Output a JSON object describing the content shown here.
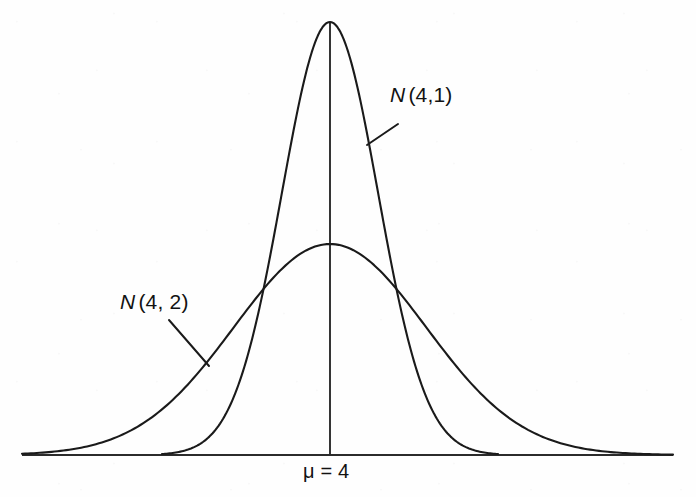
{
  "figure": {
    "background_color": "#fefefe",
    "ink_color": "#1a1a1a",
    "width": 696,
    "height": 497
  },
  "labels": {
    "curve_narrow": {
      "symbol": "N",
      "args": "(4,1)"
    },
    "curve_wide": {
      "symbol": "N",
      "args": "(4, 2)"
    },
    "mean": {
      "text": "μ = 4"
    }
  },
  "chart_data": {
    "type": "line",
    "title": "",
    "xlabel": "",
    "ylabel": "",
    "grid": false,
    "legend_position": "inline-annotations",
    "axis": {
      "baseline_y_px": 455,
      "x_start_px": 22,
      "x_end_px": 673,
      "center_x_px": 330,
      "center_tick_top_px": 22,
      "x_axis_visible": true,
      "y_axis_visible": false
    },
    "annotations": [
      {
        "text": "N (4,1)",
        "label_x_px": 390,
        "label_y_px": 84,
        "leader_from_px": [
          398,
          124
        ],
        "leader_to_px": [
          367,
          145
        ],
        "describes": "N(4,1)"
      },
      {
        "text": "N (4, 2)",
        "label_x_px": 120,
        "label_y_px": 291,
        "leader_from_px": [
          169,
          320
        ],
        "leader_to_px": [
          209,
          366
        ],
        "describes": "N(4, 2)"
      },
      {
        "text": "μ = 4",
        "label_x_px": 303,
        "label_y_px": 461,
        "describes": "mean of both distributions"
      }
    ],
    "series": [
      {
        "name": "N(4,1)",
        "distribution": "normal",
        "mean": 4,
        "variance_label": 1,
        "sigma_px": 48,
        "peak_height_px": 433,
        "peak_x_px": 330,
        "peak_y_px": 22,
        "left_tail_meets_axis_px": 168,
        "right_tail_meets_axis_px": 492,
        "x": [
          -4.0,
          -3.5,
          -3.0,
          -2.5,
          -2.0,
          -1.5,
          -1.0,
          -0.5,
          0.0,
          0.5,
          1.0,
          1.5,
          2.0,
          2.5,
          3.0,
          3.5,
          4.0
        ],
        "y": [
          0.0001,
          0.0009,
          0.0044,
          0.0175,
          0.054,
          0.1295,
          0.242,
          0.3521,
          0.3989,
          0.3521,
          0.242,
          0.1295,
          0.054,
          0.0175,
          0.0044,
          0.0009,
          0.0001
        ]
      },
      {
        "name": "N(4, 2)",
        "distribution": "normal",
        "mean": 4,
        "variance_label": 2,
        "sigma_px": 96,
        "peak_height_px": 211,
        "peak_x_px": 330,
        "peak_y_px": 244,
        "left_tail_meets_axis_px": 45,
        "right_tail_meets_axis_px": 652,
        "x": [
          -4.0,
          -3.5,
          -3.0,
          -2.5,
          -2.0,
          -1.5,
          -1.0,
          -0.5,
          0.0,
          0.5,
          1.0,
          1.5,
          2.0,
          2.5,
          3.0,
          3.5,
          4.0
        ],
        "y": [
          0.027,
          0.044,
          0.067,
          0.095,
          0.121,
          0.148,
          0.176,
          0.193,
          0.1995,
          0.193,
          0.176,
          0.148,
          0.121,
          0.095,
          0.067,
          0.044,
          0.027
        ]
      }
    ],
    "intersections_px": [
      [
        258,
        297
      ],
      [
        400,
        300
      ]
    ]
  }
}
